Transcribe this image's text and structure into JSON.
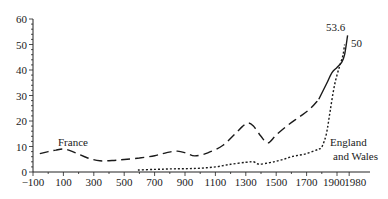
{
  "chart_data": {
    "type": "line",
    "title": "",
    "xlabel": "",
    "ylabel": "",
    "xlim": [
      -100,
      1980
    ],
    "ylim": [
      0,
      60
    ],
    "grid": false,
    "x_ticks": [
      -100,
      100,
      300,
      500,
      700,
      900,
      1100,
      1300,
      1500,
      1700,
      1900,
      1980
    ],
    "y_ticks": [
      0,
      10,
      20,
      30,
      40,
      50,
      60
    ],
    "series": [
      {
        "name": "France",
        "style": "dashed",
        "x": [
          -55,
          0,
          50,
          110,
          180,
          260,
          340,
          420,
          500,
          600,
          700,
          780,
          850,
          910,
          965,
          1050,
          1150,
          1230,
          1280,
          1315,
          1350,
          1400,
          1446,
          1500,
          1580,
          1650,
          1722,
          1780,
          1830,
          1867,
          1900,
          1930,
          1950,
          1970
        ],
        "values": [
          7.2,
          8.0,
          8.6,
          9.0,
          7.5,
          5.5,
          4.4,
          4.5,
          4.9,
          5.5,
          6.4,
          7.6,
          8.2,
          7.4,
          6.3,
          7.5,
          10.5,
          15.0,
          18.0,
          19.2,
          18.0,
          14.0,
          11.4,
          14.5,
          18.5,
          21.5,
          24.7,
          28.5,
          34.5,
          39.0,
          41.0,
          43.0,
          46.0,
          53.6
        ]
      },
      {
        "name": "England and Wales",
        "style": "dotted",
        "x": [
          590,
          700,
          800,
          900,
          1000,
          1100,
          1200,
          1300,
          1350,
          1387,
          1450,
          1500,
          1550,
          1600,
          1650,
          1700,
          1750,
          1780,
          1800,
          1830,
          1855,
          1880,
          1900,
          1920,
          1940,
          1950
        ],
        "values": [
          0.8,
          1.0,
          1.2,
          1.3,
          1.5,
          2.0,
          3.0,
          3.8,
          4.0,
          3.1,
          3.6,
          4.2,
          5.0,
          6.0,
          6.6,
          7.2,
          8.3,
          9.0,
          9.8,
          15.0,
          24.0,
          33.0,
          38.0,
          42.0,
          46.0,
          50.0
        ]
      }
    ],
    "annotations": [
      {
        "text": "France",
        "x": 160,
        "y": 11.5
      },
      {
        "text": "53.6",
        "x": 1880,
        "y": 56.5
      },
      {
        "text": "50",
        "x": 2010,
        "y": 50.5
      },
      {
        "text": "England",
        "x": 1880,
        "y": 11.2
      },
      {
        "text": "and Wales",
        "x": 1900,
        "y": 5.8
      }
    ]
  }
}
